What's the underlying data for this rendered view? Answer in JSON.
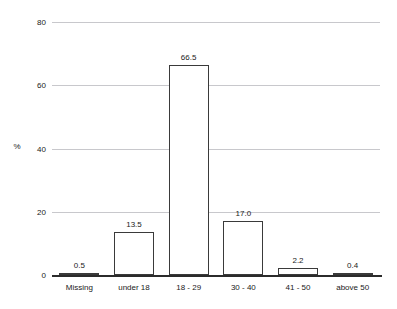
{
  "chart_data": {
    "type": "bar",
    "title": "",
    "subtitle": "",
    "xlabel": "",
    "ylabel": "%",
    "categories": [
      "Missing",
      "under 18",
      "18 - 29",
      "30 - 40",
      "41 - 50",
      "above 50"
    ],
    "values": [
      0.5,
      13.5,
      66.5,
      17.0,
      2.2,
      0.4
    ],
    "value_labels": [
      "0.5",
      "13.5",
      "66.5",
      "17.0",
      "2.2",
      "0.4"
    ],
    "ylim": [
      0,
      80
    ],
    "ytick_values": [
      0,
      20,
      40,
      60,
      80
    ],
    "ytick_labels": [
      "0",
      "20",
      "40",
      "60",
      "80"
    ],
    "grid": "horizontal",
    "legend": "none",
    "colors": {
      "background": "#ffffff",
      "bar_fill": "#ffffff",
      "bar_edge": "#3a3a3a",
      "gridline": "#c8c8cc",
      "axis": "#2b2b2b",
      "text": "#1a1a1a"
    }
  }
}
